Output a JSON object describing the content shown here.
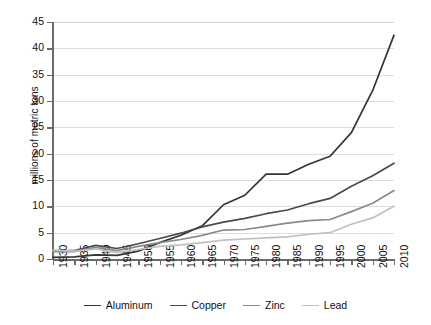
{
  "chart_data": {
    "type": "line",
    "title": "",
    "subtitle": "",
    "xlabel": "",
    "ylabel": "millions of metric tons",
    "xlim": [
      1930,
      2010
    ],
    "ylim": [
      0,
      45
    ],
    "ytick_step": 5,
    "xtick_step": 5,
    "grid": "horizontal",
    "legend_position": "bottom",
    "x": [
      1930,
      1935,
      1940,
      1945,
      1950,
      1955,
      1960,
      1965,
      1970,
      1975,
      1980,
      1985,
      1990,
      1995,
      2000,
      2005,
      2010
    ],
    "xtick_labels": [
      "1930",
      "1935",
      "1940",
      "1945",
      "1950",
      "1955",
      "1960",
      "1965",
      "1970",
      "1975",
      "1980",
      "1985",
      "1990",
      "1995",
      "2000",
      "2005",
      "2010"
    ],
    "ytick_labels": [
      "0",
      "5",
      "10",
      "15",
      "20",
      "25",
      "30",
      "35",
      "40",
      "45"
    ],
    "ytick_values": [
      0,
      5,
      10,
      15,
      20,
      25,
      30,
      35,
      40,
      45
    ],
    "series": [
      {
        "name": "Aluminum",
        "color": "#333333",
        "values": [
          0.3,
          0.4,
          0.8,
          0.7,
          1.5,
          3.1,
          4.5,
          6.3,
          10.3,
          12.1,
          16.1,
          16.1,
          18.0,
          19.5,
          24.0,
          32.0,
          42.5
        ]
      },
      {
        "name": "Copper",
        "color": "#4a4a4a",
        "values": [
          1.6,
          1.6,
          2.6,
          2.0,
          2.9,
          3.9,
          4.9,
          6.1,
          7.0,
          7.7,
          8.6,
          9.3,
          10.5,
          11.5,
          13.8,
          15.8,
          18.2
        ]
      },
      {
        "name": "Zinc",
        "color": "#8a8a8a",
        "values": [
          1.4,
          1.4,
          2.2,
          1.6,
          2.4,
          3.1,
          3.7,
          4.5,
          5.5,
          5.6,
          6.2,
          6.8,
          7.3,
          7.5,
          9.0,
          10.6,
          13.0
        ]
      },
      {
        "name": "Lead",
        "color": "#c0c0c0",
        "values": [
          1.7,
          1.5,
          1.9,
          1.2,
          1.8,
          2.4,
          2.7,
          3.1,
          3.6,
          3.8,
          4.0,
          4.2,
          4.7,
          5.0,
          6.6,
          7.8,
          10.0
        ]
      }
    ]
  },
  "legend": {
    "entries": [
      {
        "label": "Aluminum",
        "color": "#333333"
      },
      {
        "label": "Copper",
        "color": "#4a4a4a"
      },
      {
        "label": "Zinc",
        "color": "#8a8a8a"
      },
      {
        "label": "Lead",
        "color": "#c0c0c0"
      }
    ]
  },
  "axes": {
    "y_title": "millions of metric tons",
    "axis_color": "#6b6b6b",
    "grid_color": "#dcdcdc"
  }
}
